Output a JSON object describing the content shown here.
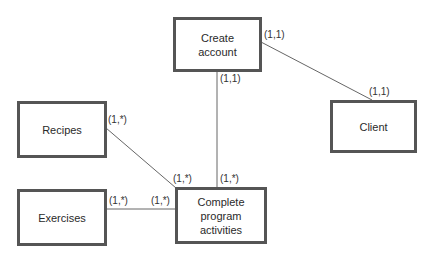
{
  "diagram": {
    "entities": [
      {
        "id": "create_account",
        "label": "Create\naccount"
      },
      {
        "id": "client",
        "label": "Client"
      },
      {
        "id": "recipes",
        "label": "Recipes"
      },
      {
        "id": "exercises",
        "label": "Exercises"
      },
      {
        "id": "complete_program",
        "label": "Complete\nprogram\nactivities"
      }
    ],
    "relationships": [
      {
        "from": "create_account",
        "to": "client",
        "from_card": "(1,1)",
        "to_card": "(1,1)"
      },
      {
        "from": "create_account",
        "to": "complete_program",
        "from_card": "(1,1)",
        "to_card": "(1,*)"
      },
      {
        "from": "recipes",
        "to": "complete_program",
        "from_card": "(1,*)",
        "to_card": "(1,*)"
      },
      {
        "from": "exercises",
        "to": "complete_program",
        "from_card": "(1,*)",
        "to_card": "(1,*)"
      }
    ],
    "colors": {
      "border": "#555555",
      "line": "#666666",
      "text": "#2a2a2a"
    }
  }
}
